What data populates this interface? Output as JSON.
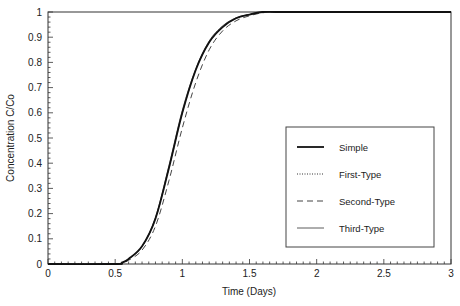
{
  "chart_data": {
    "type": "line",
    "title": "",
    "xlabel": "Time (Days)",
    "ylabel": "Concentration C/Co",
    "xlim": [
      0,
      3
    ],
    "ylim": [
      0,
      1
    ],
    "xticks": [
      "0",
      "0.5",
      "1",
      "1.5",
      "2",
      "2.5",
      "3"
    ],
    "yticks": [
      "0",
      "0.1",
      "0.2",
      "0.3",
      "0.4",
      "0.5",
      "0.6",
      "0.7",
      "0.8",
      "0.9",
      "1"
    ],
    "grid": false,
    "legend_position": "lower right (inside plot)",
    "series": [
      {
        "name": "Simple",
        "style": "solid-thick",
        "x": [
          0,
          0.5,
          0.55,
          0.6,
          0.7,
          0.8,
          0.9,
          1.0,
          1.1,
          1.2,
          1.3,
          1.4,
          1.5,
          1.6,
          1.7,
          2,
          2.5,
          3
        ],
        "y": [
          0,
          0,
          0.005,
          0.02,
          0.07,
          0.18,
          0.38,
          0.6,
          0.77,
          0.88,
          0.94,
          0.975,
          0.99,
          1.0,
          1.0,
          1.0,
          1.0,
          1.0
        ]
      },
      {
        "name": "First-Type",
        "style": "dotted",
        "x": [
          0,
          0.5,
          0.55,
          0.6,
          0.7,
          0.8,
          0.9,
          1.0,
          1.1,
          1.2,
          1.3,
          1.4,
          1.5,
          1.6,
          1.7,
          2,
          2.5,
          3
        ],
        "y": [
          0,
          0,
          0.005,
          0.02,
          0.07,
          0.18,
          0.38,
          0.6,
          0.77,
          0.88,
          0.94,
          0.975,
          0.99,
          1.0,
          1.0,
          1.0,
          1.0,
          1.0
        ]
      },
      {
        "name": "Second-Type",
        "style": "dashed",
        "x": [
          0,
          0.5,
          0.55,
          0.6,
          0.7,
          0.8,
          0.9,
          1.0,
          1.1,
          1.2,
          1.3,
          1.4,
          1.5,
          1.6,
          1.7,
          2,
          2.5,
          3
        ],
        "y": [
          0,
          0,
          0.004,
          0.015,
          0.055,
          0.15,
          0.33,
          0.54,
          0.72,
          0.85,
          0.925,
          0.965,
          0.985,
          0.997,
          1.0,
          1.0,
          1.0,
          1.0
        ]
      },
      {
        "name": "Third-Type",
        "style": "solid-thin",
        "x": [
          0,
          0.5,
          0.55,
          0.6,
          0.7,
          0.8,
          0.9,
          1.0,
          1.1,
          1.2,
          1.3,
          1.4,
          1.5,
          1.6,
          1.7,
          2,
          2.5,
          3
        ],
        "y": [
          0,
          0,
          0.005,
          0.02,
          0.07,
          0.185,
          0.39,
          0.61,
          0.775,
          0.885,
          0.945,
          0.977,
          0.99,
          1.0,
          1.0,
          1.0,
          1.0,
          1.0
        ]
      }
    ]
  }
}
